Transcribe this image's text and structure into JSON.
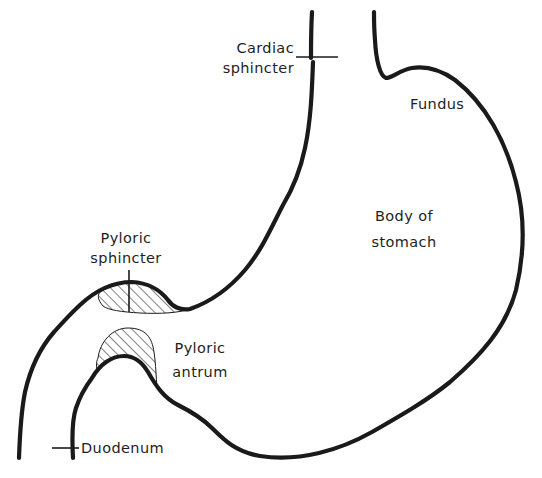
{
  "diagram": {
    "stroke_color": "#1a1a1a",
    "background_color": "#ffffff",
    "labels": {
      "cardiac_sphincter": [
        "Cardiac",
        "sphincter"
      ],
      "fundus": "Fundus",
      "body_of_stomach": [
        "Body of",
        "stomach"
      ],
      "pyloric_sphincter": [
        "Pyloric",
        "sphincter"
      ],
      "pyloric_antrum": [
        "Pyloric",
        "antrum"
      ],
      "duodenum": "Duodenum"
    }
  }
}
